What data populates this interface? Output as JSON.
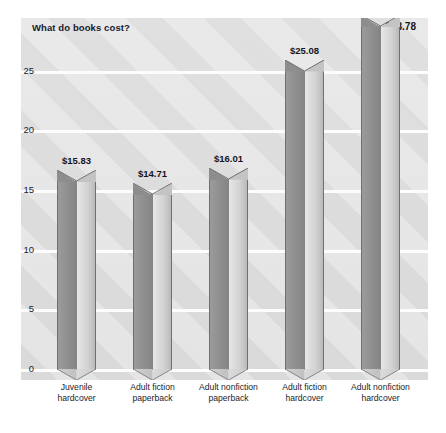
{
  "chart_data": {
    "type": "bar",
    "title": "What do books cost?",
    "xlabel": "",
    "ylabel": "",
    "ylim": [
      0,
      27.5
    ],
    "grid": true,
    "legend": "none",
    "yticks": [
      "0",
      "5",
      "10",
      "15",
      "20",
      "25"
    ],
    "ytick_values": [
      0,
      5,
      10,
      15,
      20,
      25
    ],
    "categories": [
      "Juvenile hardcover",
      "Adult fiction paperback",
      "Adult nonfiction paperback",
      "Adult fiction hardcover",
      "Adult nonfiction hardcover"
    ],
    "category_lines": [
      [
        "Juvenile",
        "hardcover"
      ],
      [
        "Adult fiction",
        "paperback"
      ],
      [
        "Adult nonfiction",
        "paperback"
      ],
      [
        "Adult fiction",
        "hardcover"
      ],
      [
        "Adult nonfiction",
        "hardcover"
      ]
    ],
    "values": [
      15.83,
      14.71,
      16.01,
      25.08,
      28.78
    ],
    "value_labels": [
      "$15.83",
      "$14.71",
      "$16.01",
      "$25.08",
      "$28.78"
    ],
    "colors": {
      "panel_background": "#d8d8d8",
      "gridline": "#fdfdfd",
      "bar_left_face": "#8e8e8e",
      "bar_right_face": "#d2d2d2",
      "title_text": "#1a1a2e",
      "label_text": "#15151f"
    }
  }
}
